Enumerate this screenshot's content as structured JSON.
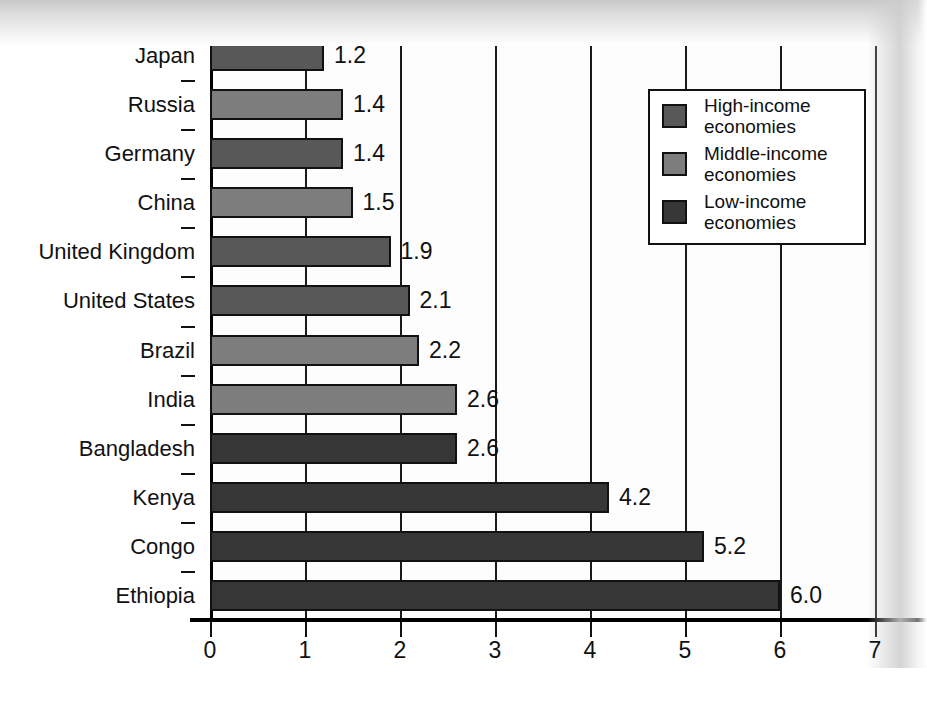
{
  "title_remnant": "Figure   Fertility Rates",
  "chart_data": {
    "type": "bar",
    "orientation": "horizontal",
    "title": "",
    "xlabel": "Children per woman",
    "ylabel": "",
    "xlim": [
      0,
      7
    ],
    "xticks": [
      "0",
      "1",
      "2",
      "3",
      "4",
      "5",
      "6",
      "7"
    ],
    "grid": true,
    "legend_position": "top-right",
    "categories": [
      "Japan",
      "Russia",
      "Germany",
      "China",
      "United Kingdom",
      "United States",
      "Brazil",
      "India",
      "Bangladesh",
      "Kenya",
      "Congo",
      "Ethiopia"
    ],
    "values": [
      1.2,
      1.4,
      1.4,
      1.5,
      1.9,
      2.1,
      2.2,
      2.6,
      2.6,
      4.2,
      5.2,
      6.0
    ],
    "value_labels": [
      "1.2",
      "1.4",
      "1.4",
      "1.5",
      "1.9",
      "2.1",
      "2.2",
      "2.6",
      "2.6",
      "4.2",
      "5.2",
      "6.0"
    ],
    "groups": [
      "high",
      "middle",
      "high",
      "middle",
      "high",
      "high",
      "middle",
      "middle",
      "low",
      "low",
      "low",
      "low"
    ],
    "series": [
      {
        "name": "High-income economies",
        "key": "high",
        "color": "#585858",
        "points": [
          {
            "category": "Japan",
            "value": 1.2
          },
          {
            "category": "Germany",
            "value": 1.4
          },
          {
            "category": "United Kingdom",
            "value": 1.9
          },
          {
            "category": "United States",
            "value": 2.1
          }
        ]
      },
      {
        "name": "Middle-income economies",
        "key": "middle",
        "color": "#7d7d7d",
        "points": [
          {
            "category": "Russia",
            "value": 1.4
          },
          {
            "category": "China",
            "value": 1.5
          },
          {
            "category": "Brazil",
            "value": 2.2
          },
          {
            "category": "India",
            "value": 2.6
          }
        ]
      },
      {
        "name": "Low-income economies",
        "key": "low",
        "color": "#363636",
        "points": [
          {
            "category": "Bangladesh",
            "value": 2.6
          },
          {
            "category": "Kenya",
            "value": 4.2
          },
          {
            "category": "Congo",
            "value": 5.2
          },
          {
            "category": "Ethiopia",
            "value": 6.0
          }
        ]
      }
    ]
  },
  "legend": {
    "items": [
      {
        "label_line1": "High-income",
        "label_line2": "economies",
        "key": "high",
        "color": "#585858"
      },
      {
        "label_line1": "Middle-income",
        "label_line2": "economies",
        "key": "middle",
        "color": "#7d7d7d"
      },
      {
        "label_line1": "Low-income",
        "label_line2": "economies",
        "key": "low",
        "color": "#363636"
      }
    ]
  },
  "axis": {
    "x_title": "Children per woman",
    "tick_labels": [
      "0",
      "1",
      "2",
      "3",
      "4",
      "5",
      "6",
      "7"
    ]
  },
  "colors": {
    "high_income": "#585858",
    "middle_income": "#7d7d7d",
    "low_income": "#363636",
    "axis": "#111111",
    "plot_background": "#fdfdfd"
  }
}
